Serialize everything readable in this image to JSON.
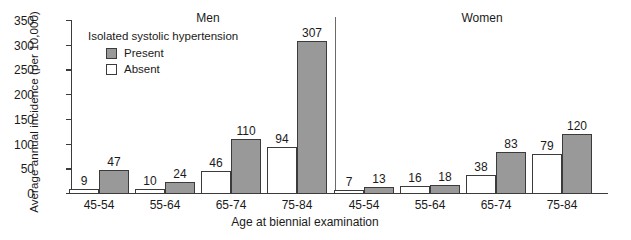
{
  "chart_data": {
    "type": "bar",
    "title": "",
    "xlabel": "Age at biennial examination",
    "ylabel": "Average annual incidence (per 10,000)",
    "ylim": [
      0,
      350
    ],
    "yticks": [
      0,
      50,
      100,
      150,
      200,
      250,
      300,
      350
    ],
    "grid": false,
    "legend_title": "Isolated systolic hypertension",
    "legend_position": "upper-left-inside",
    "panels": [
      {
        "name": "Men",
        "categories": [
          "45-54",
          "55-64",
          "65-74",
          "75-84"
        ],
        "series": [
          {
            "name": "Absent",
            "values": [
              9,
              10,
              46,
              94
            ]
          },
          {
            "name": "Present",
            "values": [
              47,
              24,
              110,
              307
            ]
          }
        ]
      },
      {
        "name": "Women",
        "categories": [
          "45-54",
          "55-64",
          "65-74",
          "75-84"
        ],
        "series": [
          {
            "name": "Absent",
            "values": [
              7,
              16,
              38,
              79
            ]
          },
          {
            "name": "Present",
            "values": [
              13,
              18,
              83,
              120
            ]
          }
        ]
      }
    ],
    "series_colors": {
      "Present": "#999999",
      "Absent": "#ffffff"
    },
    "outline_color": "#3b3b3b"
  },
  "axis": {
    "ylabel": "Average annual incidence (per 10,000)",
    "xlabel": "Age at biennial examination",
    "yticks": [
      "350",
      "300",
      "250",
      "200",
      "150",
      "100",
      "50",
      "0"
    ]
  },
  "legend": {
    "title": "Isolated systolic hypertension",
    "items": [
      {
        "label": "Present",
        "color": "#999999"
      },
      {
        "label": "Absent",
        "color": "#ffffff"
      }
    ]
  },
  "panels": {
    "men": {
      "title": "Men",
      "xticks": [
        "45-54",
        "55-64",
        "65-74",
        "75-84"
      ]
    },
    "women": {
      "title": "Women",
      "xticks": [
        "45-54",
        "55-64",
        "65-74",
        "75-84"
      ]
    }
  },
  "bar_values": {
    "men": {
      "absent": [
        "9",
        "10",
        "46",
        "94"
      ],
      "present": [
        "47",
        "24",
        "110",
        "307"
      ]
    },
    "women": {
      "absent": [
        "7",
        "16",
        "38",
        "79"
      ],
      "present": [
        "13",
        "18",
        "83",
        "120"
      ]
    }
  }
}
